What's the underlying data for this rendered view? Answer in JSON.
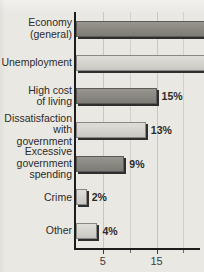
{
  "chart_data": {
    "type": "bar",
    "orientation": "horizontal",
    "title": "",
    "subtitle": "",
    "xlabel": "",
    "ylabel": "",
    "xlim": [
      0,
      35
    ],
    "grid": true,
    "legend": null,
    "categories": [
      "Economy\n(general)",
      "Unemployment",
      "High cost\nof living",
      "Dissatisfaction\nwith\ngovernment",
      "Excessive\ngovernment\nspending",
      "Crime",
      "Other"
    ],
    "values": [
      31,
      26,
      15,
      13,
      9,
      2,
      4
    ],
    "data_labels": [
      "31%",
      "26%",
      "15%",
      "13%",
      "9%",
      "2%",
      "4%"
    ],
    "bar_styles": [
      "dark",
      "light",
      "dark",
      "light",
      "dark",
      "light",
      "light"
    ],
    "label_placement": [
      "inside",
      "outside",
      "outside",
      "outside",
      "outside",
      "outside",
      "outside"
    ],
    "xticks": [
      5,
      15,
      25,
      35
    ],
    "xticklabels": [
      "5",
      "15",
      "25",
      "35"
    ],
    "xminorticks": [
      10,
      20,
      30
    ],
    "gridline_values": [
      5,
      10,
      15,
      20,
      25,
      30,
      35
    ],
    "colors": {
      "background": "#eae8e3",
      "bar_dark": "#8b8982",
      "bar_light": "#d6d4ce",
      "bar_shadow": "#2e2e2e",
      "axis": "#1c1c1c",
      "gridline": "#c9c7c1",
      "label_text": "#2b2b2b",
      "value_text_outside": "#2a2a2a",
      "value_text_inside": "#ffffff"
    }
  }
}
